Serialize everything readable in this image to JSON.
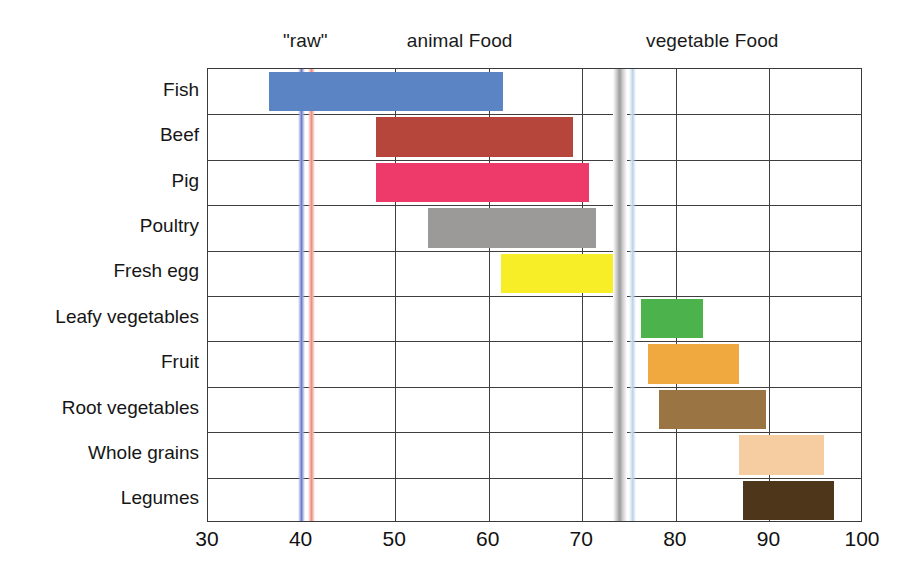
{
  "chart_data": {
    "type": "bar",
    "orientation": "horizontal",
    "subtype": "range-bar",
    "title": "",
    "xlabel": "",
    "ylabel": "",
    "xlim": [
      30,
      100
    ],
    "xticks": [
      30,
      40,
      50,
      60,
      70,
      80,
      90,
      100
    ],
    "grid": true,
    "legend": null,
    "band_headings": [
      {
        "text": "\"raw\"",
        "x_center": 40.5
      },
      {
        "text": "animal Food",
        "x_center": 57.0
      },
      {
        "text": "vegetable Food",
        "x_center": 84.0
      }
    ],
    "categories": [
      "Fish",
      "Beef",
      "Pig",
      "Poultry",
      "Fresh egg",
      "Leafy vegetables",
      "Fruit",
      "Root vegetables",
      "Whole grains",
      "Legumes"
    ],
    "ranges": [
      {
        "category": "Fish",
        "start": 36.5,
        "end": 61.5,
        "color": "#5B84C4"
      },
      {
        "category": "Beef",
        "start": 48.0,
        "end": 69.0,
        "color": "#B6453C"
      },
      {
        "category": "Pig",
        "start": 48.0,
        "end": 70.7,
        "color": "#EE3A6B"
      },
      {
        "category": "Poultry",
        "start": 53.5,
        "end": 71.5,
        "color": "#9C9A99"
      },
      {
        "category": "Fresh egg",
        "start": 61.3,
        "end": 73.3,
        "color": "#F7EE28"
      },
      {
        "category": "Leafy vegetables",
        "start": 76.3,
        "end": 82.9,
        "color": "#4CB24C"
      },
      {
        "category": "Fruit",
        "start": 77.0,
        "end": 86.8,
        "color": "#EFA93F"
      },
      {
        "category": "Root vegetables",
        "start": 78.2,
        "end": 89.6,
        "color": "#9B7444"
      },
      {
        "category": "Whole grains",
        "start": 86.7,
        "end": 95.8,
        "color": "#F6CDA0"
      },
      {
        "category": "Legumes",
        "start": 87.2,
        "end": 96.9,
        "color": "#4D3619"
      }
    ],
    "marker_lines": [
      {
        "name": "blue-marker",
        "value": 40.0,
        "color": "#6f78c9"
      },
      {
        "name": "red-marker",
        "value": 41.1,
        "color": "#ef8f82"
      },
      {
        "name": "gray-marker",
        "value": 74.0,
        "color": "#9c9c9c"
      },
      {
        "name": "light-blue-marker",
        "value": 75.4,
        "color": "#b9d2e8"
      }
    ]
  }
}
